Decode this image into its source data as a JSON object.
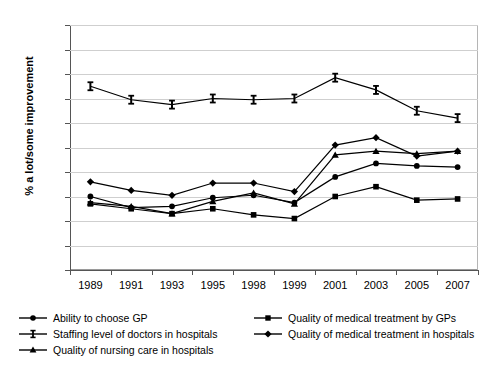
{
  "chart_data": {
    "type": "line",
    "title": "",
    "subtitle": "",
    "xlabel": "",
    "ylabel": "% a lot/some improvement",
    "categories": [
      "1989",
      "1991",
      "1993",
      "1995",
      "1998",
      "1999",
      "2001",
      "2003",
      "2005",
      "2007"
    ],
    "ylim": [
      0,
      100
    ],
    "yticks": [
      0,
      10,
      20,
      30,
      40,
      50,
      60,
      70,
      80,
      90,
      100
    ],
    "grid": true,
    "legend_position": "bottom",
    "series": [
      {
        "name": "Ability to choose GP",
        "marker": "circle",
        "color": "#000000",
        "values": [
          30,
          25.5,
          26,
          29.5,
          30.5,
          27.5,
          38,
          43.5,
          42.5,
          42
        ]
      },
      {
        "name": "Quality of medical treatment by GPs",
        "marker": "square",
        "color": "#000000",
        "values": [
          27,
          25,
          23,
          25,
          22.5,
          21,
          30,
          34,
          28.5,
          29
        ]
      },
      {
        "name": "Staffing level of doctors in hospitals",
        "marker": "ibar",
        "color": "#000000",
        "values": [
          75,
          69.5,
          67.5,
          70,
          69.5,
          70,
          78.5,
          73.5,
          65,
          62
        ]
      },
      {
        "name": "Quality of medical treatment in hospitals",
        "marker": "diamond",
        "color": "#000000",
        "values": [
          36,
          32.5,
          30.5,
          35.5,
          35.5,
          32,
          51,
          54,
          46.5,
          48.5
        ]
      },
      {
        "name": "Quality of nursing care in hospitals",
        "marker": "triangle",
        "color": "#000000",
        "values": [
          27.5,
          26,
          23,
          28,
          31.5,
          27,
          47,
          48.5,
          47.5,
          48.5
        ]
      }
    ]
  }
}
